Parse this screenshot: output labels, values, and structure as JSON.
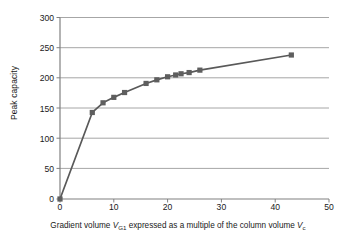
{
  "chart_data": {
    "type": "line",
    "title": "",
    "xlabel_text": "Gradient volume V_{G1} expressed as a multiple of the column volume V_{c}",
    "xlabel_parts": {
      "before_v1": "Gradient volume ",
      "v1": "V",
      "v1_sub": "G1",
      "middle": " expressed as a multiple of the column volume ",
      "v2": "V",
      "v2_sub": "c"
    },
    "ylabel": "Peak capacity",
    "xlim": [
      0,
      50
    ],
    "ylim": [
      0,
      300
    ],
    "xticks": [
      0,
      10,
      20,
      30,
      40,
      50
    ],
    "yticks": [
      0,
      50,
      100,
      150,
      200,
      250,
      300
    ],
    "grid": "horizontal",
    "legend": "none",
    "marker": "square",
    "series": [
      {
        "name": "Peak capacity vs gradient volume",
        "color": "#595959",
        "x": [
          0,
          6,
          8,
          10,
          12,
          16,
          18,
          20,
          21.5,
          22.5,
          24,
          26,
          43
        ],
        "y": [
          0,
          143,
          159,
          168,
          176,
          191,
          197,
          202,
          205,
          207,
          209,
          213,
          238
        ]
      }
    ]
  },
  "colors": {
    "line": "#595959",
    "marker": "#5e5e5e",
    "grid": "#a6a6a6",
    "axis": "#808080",
    "text": "#1a1a1a"
  }
}
